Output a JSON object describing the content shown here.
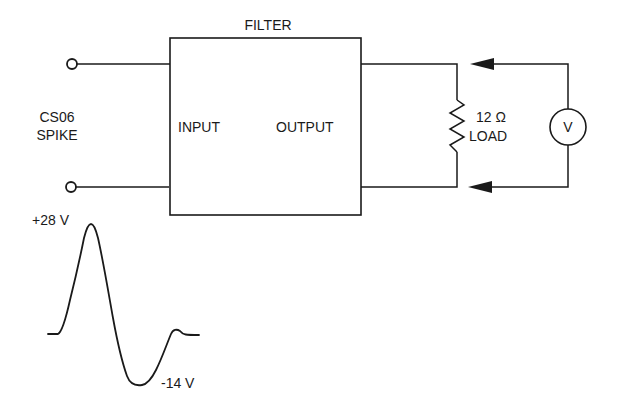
{
  "diagram": {
    "title": "FILTER",
    "source_label_line1": "CS06",
    "source_label_line2": "SPIKE",
    "filter_input_label": "INPUT",
    "filter_output_label": "OUTPUT",
    "load": {
      "resistance": "12 Ω",
      "label": "LOAD"
    },
    "voltmeter_symbol": "V",
    "waveform": {
      "peak_label": "+28 V",
      "trough_label": "-14 V"
    },
    "colors": {
      "line": "#1a1a1a",
      "background": "#ffffff"
    }
  }
}
